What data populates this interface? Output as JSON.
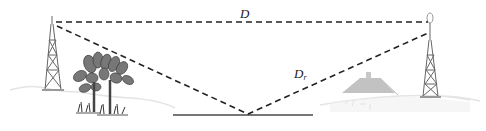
{
  "diagram": {
    "labels": {
      "direct_path": "D",
      "reflected_path_main": "D",
      "reflected_path_sub": "r"
    },
    "elements": {
      "transmitter": "left lattice tower",
      "receiver": "right lattice tower with antenna",
      "obstacles": [
        "trees",
        "house"
      ],
      "reflector": "ground plane segment"
    },
    "colors": {
      "line": "#222222",
      "ground": "#777777",
      "tower": "#666666",
      "tree": "#555555",
      "house": "#bdbdbd",
      "terrain": "#e6e6e6"
    }
  }
}
